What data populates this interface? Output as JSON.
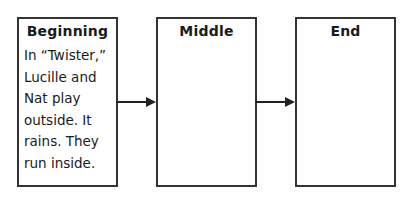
{
  "diagram": {
    "boxes": [
      {
        "title": "Beginning",
        "text": "In “Twister,”\nLucille and\nNat play\noutside. It\nrains. They\nrun inside."
      },
      {
        "title": "Middle",
        "text": ""
      },
      {
        "title": "End",
        "text": ""
      }
    ],
    "edges": [
      {
        "from": "Beginning",
        "to": "Middle"
      },
      {
        "from": "Middle",
        "to": "End"
      }
    ]
  }
}
